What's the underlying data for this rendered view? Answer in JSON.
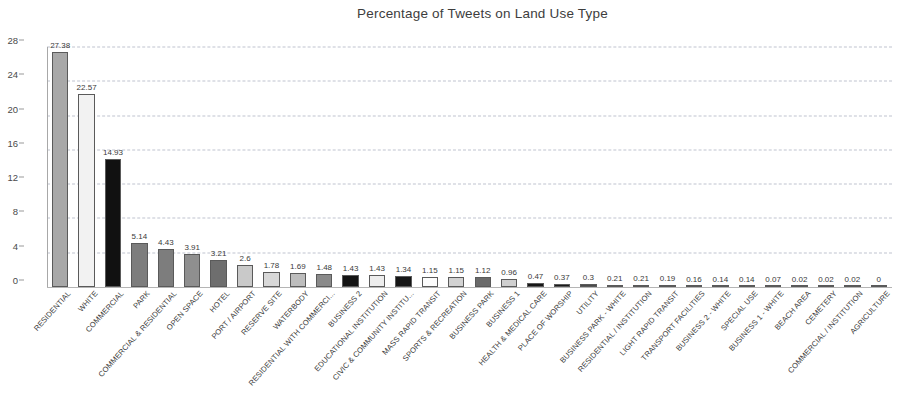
{
  "chart": {
    "title": "Percentage of Tweets on Land Use Type"
  },
  "chart_data": {
    "type": "bar",
    "title": "Percentage of Tweets on Land Use Type",
    "xlabel": "",
    "ylabel": "",
    "ylim": [
      0,
      28
    ],
    "yticks": [
      0,
      4,
      8,
      12,
      16,
      20,
      24,
      28
    ],
    "grid": true,
    "legend": "none",
    "categories": [
      "RESIDENTIAL",
      "WHITE",
      "COMMERCIAL",
      "PARK",
      "COMMERCIAL & RESIDENTIAL",
      "OPEN SPACE",
      "HOTEL",
      "PORT / AIRPORT",
      "RESERVE SITE",
      "WATERBODY",
      "RESIDENTIAL WITH COMMERCI...",
      "BUSINESS 2",
      "EDUCATIONAL INSTITUTION",
      "CIVIC & COMMUNITY INSTITU...",
      "MASS RAPID TRANSIT",
      "SPORTS & RECREATION",
      "BUSINESS PARK",
      "BUSINESS 1",
      "HEALTH & MEDICAL CARE",
      "PLACE OF WORSHIP",
      "UTILITY",
      "BUSINESS PARK - WHITE",
      "RESIDENTIAL / INSTITUTION",
      "LIGHT RAPID TRANSIT",
      "TRANSPORT FACILITIES",
      "BUSINESS 2 - WHITE",
      "SPECIAL USE",
      "BUSINESS 1 - WHITE",
      "BEACH AREA",
      "CEMETERY",
      "COMMERCIAL / INSTITUTION",
      "AGRICULTURE"
    ],
    "values": [
      27.38,
      22.57,
      14.93,
      5.14,
      4.43,
      3.91,
      3.21,
      2.6,
      1.78,
      1.69,
      1.48,
      1.43,
      1.43,
      1.34,
      1.15,
      1.15,
      1.12,
      0.96,
      0.47,
      0.37,
      0.3,
      0.21,
      0.21,
      0.19,
      0.16,
      0.14,
      0.14,
      0.07,
      0.02,
      0.02,
      0.02,
      0
    ],
    "value_labels": [
      "27.38",
      "22.57",
      "14.93",
      "5.14",
      "4.43",
      "3.91",
      "3.21",
      "2.6",
      "1.78",
      "1.69",
      "1.48",
      "1.43",
      "1.43",
      "1.34",
      "1.15",
      "1.15",
      "1.12",
      "0.96",
      "0.47",
      "0.37",
      "0.3",
      "0.21",
      "0.21",
      "0.19",
      "0.16",
      "0.14",
      "0.14",
      "0.07",
      "0.02",
      "0.02",
      "0.02",
      "0"
    ],
    "bar_fills": [
      "#a8a8a8",
      "#f2f2f2",
      "#111111",
      "#7d7d7d",
      "#7d7d7d",
      "#8f8f8f",
      "#6e6e6e",
      "#c9c9c9",
      "#d8d8d8",
      "#bdbdbd",
      "#8a8a8a",
      "#141414",
      "#ededed",
      "#161616",
      "#fdfdfd",
      "#d2d2d2",
      "#6a6a6a",
      "#cfcfcf",
      "#171717",
      "#1a1a1a",
      "#4a4a4a",
      "#1c1c1c",
      "#1c1c1c",
      "#1d1d1d",
      "#151515",
      "#1a1a1a",
      "#1a1a1a",
      "#202020",
      "#9d9d9d",
      "#9d9d9d",
      "#9d9d9d",
      "#ffffff"
    ]
  }
}
